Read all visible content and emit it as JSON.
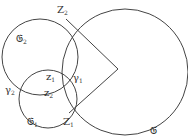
{
  "diagram": {
    "stroke_color": "#444444",
    "circles": [
      {
        "id": "C",
        "cx": 125,
        "cy": 72,
        "r": 63
      },
      {
        "id": "C2",
        "cx": 40,
        "cy": 57,
        "r": 38
      },
      {
        "id": "C1",
        "cx": 48,
        "cy": 99,
        "r": 28
      },
      {
        "id": "gamma1",
        "cx": 118,
        "cy": 70,
        "r": 0
      }
    ],
    "labels": {
      "C": {
        "main": "𝔊",
        "sub": ""
      },
      "C2": {
        "main": "𝔊",
        "sub": "2"
      },
      "C1": {
        "main": "𝔊",
        "sub": "1"
      },
      "Z2": {
        "main": "Z",
        "sub": "2"
      },
      "Z1": {
        "main": "Z",
        "sub": "1"
      },
      "z1": {
        "main": "z",
        "sub": "1"
      },
      "z2": {
        "main": "z",
        "sub": "2"
      },
      "gamma1": {
        "main": "γ",
        "sub": "1"
      },
      "gamma2": {
        "main": "γ",
        "sub": "2"
      }
    }
  }
}
